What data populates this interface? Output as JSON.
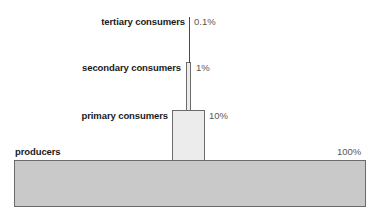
{
  "diagram": {
    "background_color": "#ffffff",
    "outline_color": "#6b6b6b",
    "label_color": "#1a1a1a",
    "percent_color": "#575757"
  },
  "levels": [
    {
      "name": "tertiary-consumers",
      "label": "tertiary consumers",
      "percent": "0.1%",
      "fill": "#4a4a4a"
    },
    {
      "name": "secondary-consumers",
      "label": "secondary consumers",
      "percent": "1%",
      "fill": "#ececec"
    },
    {
      "name": "primary-consumers",
      "label": "primary consumers",
      "percent": "10%",
      "fill": "#ececec"
    },
    {
      "name": "producers",
      "label": "producers",
      "percent": "100%",
      "fill": "#c9c9c9"
    }
  ],
  "chart_data": {
    "type": "bar",
    "categories": [
      "producers",
      "primary consumers",
      "secondary consumers",
      "tertiary consumers"
    ],
    "values": [
      100,
      10,
      1,
      0.1
    ],
    "value_labels": [
      "100%",
      "10%",
      "1%",
      "0.1%"
    ],
    "xlabel": "",
    "ylabel": "percentage of energy",
    "ylim": [
      0,
      100
    ],
    "orientation": "vertical-stacked-pyramid",
    "grid": false,
    "legend": "none"
  }
}
